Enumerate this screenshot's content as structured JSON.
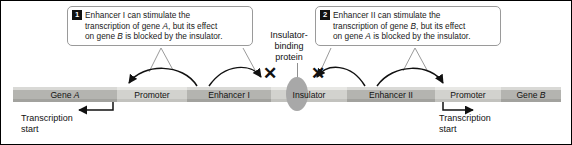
{
  "diagram": {
    "callouts": [
      {
        "number": "1",
        "text_line1": "Enhancer I can stimulate the",
        "text_line2_pre": "transcription of gene ",
        "text_line2_gene": "A",
        "text_line2_post": ", but its effect",
        "text_line3_pre": "on gene ",
        "text_line3_gene": "B",
        "text_line3_post": " is blocked by the insulator."
      },
      {
        "number": "2",
        "text_line1": "Enhancer II can stimulate the",
        "text_line2_pre": "transcription of gene ",
        "text_line2_gene": "B",
        "text_line2_post": ", but its effect",
        "text_line3_pre": "on gene ",
        "text_line3_gene": "A",
        "text_line3_post": " is blocked by the insulator."
      }
    ],
    "protein_label": {
      "line1": "Insulator-",
      "line2": "binding",
      "line3": "protein"
    },
    "dna_segments": [
      {
        "name": "gene-a",
        "label_pre": "Gene ",
        "label_gene": "A",
        "shade": "dark"
      },
      {
        "name": "promoter-a",
        "label_pre": "Promoter",
        "label_gene": "",
        "shade": "light"
      },
      {
        "name": "enhancer-1",
        "label_pre": "Enhancer I",
        "label_gene": "",
        "shade": "dark"
      },
      {
        "name": "insulator",
        "label_pre": "Insulator",
        "label_gene": "",
        "shade": "light"
      },
      {
        "name": "enhancer-2",
        "label_pre": "Enhancer II",
        "label_gene": "",
        "shade": "dark"
      },
      {
        "name": "promoter-b",
        "label_pre": "Promoter",
        "label_gene": "",
        "shade": "light"
      },
      {
        "name": "gene-b",
        "label_pre": "Gene ",
        "label_gene": "B",
        "shade": "dark"
      }
    ],
    "transcription_start": {
      "line1": "Transcription",
      "line2": "start"
    },
    "block_marks": [
      {
        "name": "x-left",
        "glyph": "✕"
      },
      {
        "name": "x-right",
        "glyph": "✕"
      }
    ],
    "colors": {
      "dna_dark": "#b4b4b0",
      "dna_light": "#d2d2ce",
      "protein": "#a8a8a8",
      "ink": "#111111",
      "callout_border": "#9a9a9a"
    }
  }
}
